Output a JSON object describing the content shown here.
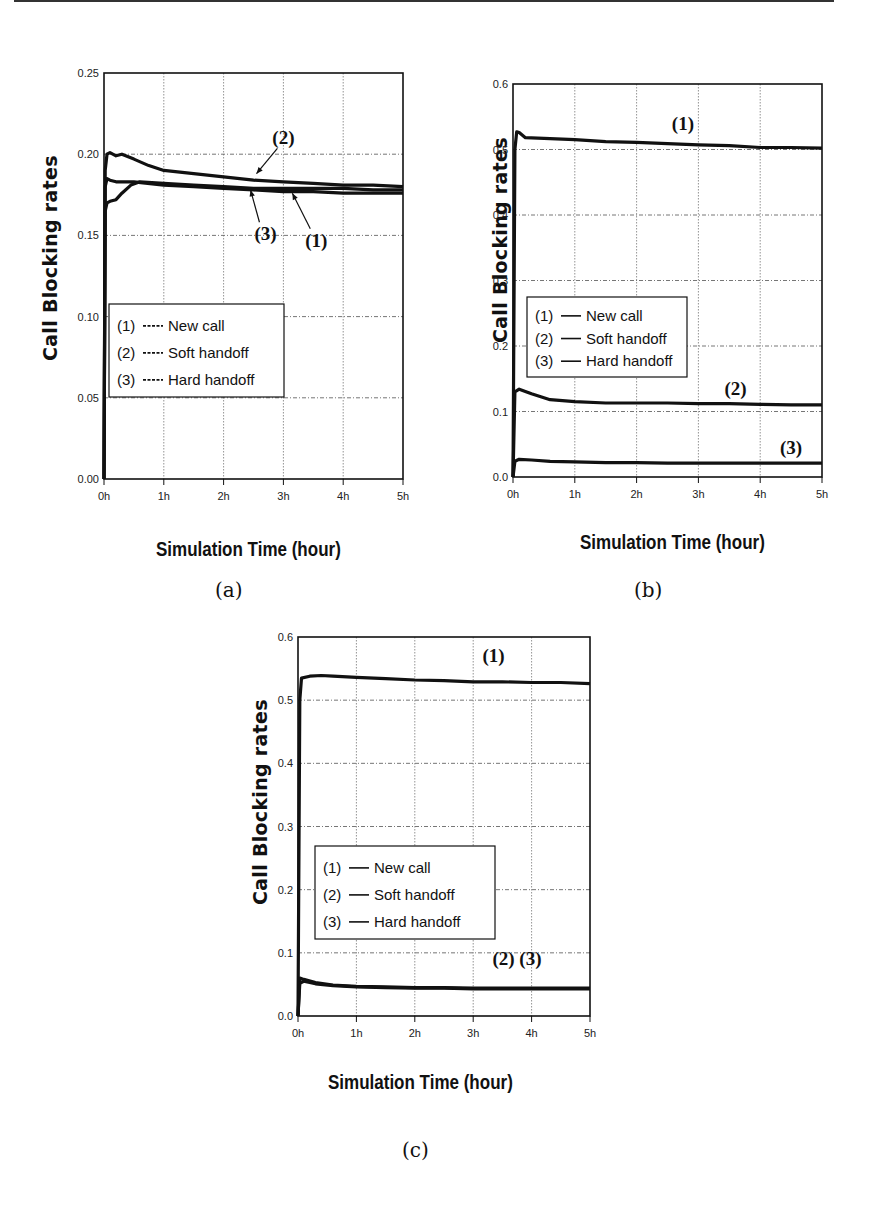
{
  "figure": {
    "captions": [
      "(a)",
      "(b)",
      "(c)"
    ],
    "xlabel": "Simulation Time (hour)",
    "ylabel": "Call Blocking rates"
  },
  "chart_data": [
    {
      "id": "a",
      "type": "line",
      "caption": "(a)",
      "xlabel": "Simulation Time (hour)",
      "ylabel": "Call Blocking rates",
      "x_ticks": [
        "0h",
        "1h",
        "2h",
        "3h",
        "4h",
        "5h"
      ],
      "y_ticks": [
        "0.00",
        "0.05",
        "0.10",
        "0.15",
        "0.20",
        "0.25"
      ],
      "xlim": [
        0,
        5
      ],
      "ylim": [
        0,
        0.25
      ],
      "grid": true,
      "legend": {
        "position": "lower-left",
        "entries": [
          {
            "marker": "(1)",
            "line": "dashed",
            "label": "New call"
          },
          {
            "marker": "(2)",
            "line": "dashed",
            "label": "Soft handoff"
          },
          {
            "marker": "(3)",
            "line": "dashed",
            "label": "Hard handoff"
          }
        ]
      },
      "annotations": [
        {
          "text": "(2)",
          "x": 3.0,
          "y": 0.206,
          "arrow_to": [
            2.55,
            0.188
          ]
        },
        {
          "text": "(3)",
          "x": 2.7,
          "y": 0.147,
          "arrow_to": [
            2.45,
            0.178
          ]
        },
        {
          "text": "(1)",
          "x": 3.55,
          "y": 0.143,
          "arrow_to": [
            3.15,
            0.176
          ]
        }
      ],
      "series": [
        {
          "name": "(1) New call",
          "x": [
            0,
            0.02,
            0.05,
            0.1,
            0.2,
            0.3,
            0.5,
            1,
            1.5,
            2,
            2.5,
            3,
            3.5,
            4,
            4.5,
            5
          ],
          "values": [
            0,
            0.18,
            0.185,
            0.184,
            0.183,
            0.183,
            0.183,
            0.181,
            0.18,
            0.179,
            0.178,
            0.177,
            0.177,
            0.176,
            0.176,
            0.176
          ]
        },
        {
          "name": "(2) Soft handoff",
          "x": [
            0,
            0.02,
            0.05,
            0.1,
            0.2,
            0.3,
            0.5,
            0.75,
            1,
            1.5,
            2,
            2.5,
            3,
            3.5,
            4,
            4.5,
            5
          ],
          "values": [
            0,
            0.19,
            0.2,
            0.201,
            0.199,
            0.2,
            0.197,
            0.193,
            0.19,
            0.188,
            0.186,
            0.184,
            0.183,
            0.182,
            0.181,
            0.181,
            0.18
          ]
        },
        {
          "name": "(3) Hard handoff",
          "x": [
            0,
            0.02,
            0.05,
            0.1,
            0.2,
            0.3,
            0.45,
            0.6,
            1,
            1.5,
            2,
            2.5,
            3,
            3.5,
            4,
            4.5,
            5
          ],
          "values": [
            0,
            0.165,
            0.17,
            0.171,
            0.172,
            0.176,
            0.181,
            0.183,
            0.182,
            0.181,
            0.18,
            0.179,
            0.179,
            0.179,
            0.179,
            0.178,
            0.178
          ]
        }
      ]
    },
    {
      "id": "b",
      "type": "line",
      "caption": "(b)",
      "xlabel": "Simulation Time (hour)",
      "ylabel": "Call Blocking rates",
      "x_ticks": [
        "0h",
        "1h",
        "2h",
        "3h",
        "4h",
        "5h"
      ],
      "y_ticks": [
        "0.0",
        "0.1",
        "0.2",
        "0.3",
        "0.4",
        "0.5",
        "0.6"
      ],
      "xlim": [
        0,
        5
      ],
      "ylim": [
        0,
        0.6
      ],
      "grid": true,
      "legend": {
        "position": "center-left",
        "entries": [
          {
            "marker": "(1)",
            "line": "solid",
            "label": "New call"
          },
          {
            "marker": "(2)",
            "line": "solid",
            "label": "Soft handoff"
          },
          {
            "marker": "(3)",
            "line": "solid",
            "label": "Hard handoff"
          }
        ]
      },
      "annotations": [
        {
          "text": "(1)",
          "x": 2.75,
          "y": 0.53
        },
        {
          "text": "(2)",
          "x": 3.6,
          "y": 0.125
        },
        {
          "text": "(3)",
          "x": 4.5,
          "y": 0.035
        }
      ],
      "series": [
        {
          "name": "(1) New call",
          "x": [
            0,
            0.03,
            0.06,
            0.1,
            0.2,
            0.5,
            1,
            1.5,
            2,
            2.5,
            3,
            3.5,
            4,
            4.5,
            5
          ],
          "values": [
            0,
            0.5,
            0.527,
            0.526,
            0.518,
            0.517,
            0.515,
            0.512,
            0.511,
            0.509,
            0.507,
            0.506,
            0.503,
            0.503,
            0.502
          ]
        },
        {
          "name": "(2) Soft handoff",
          "x": [
            0,
            0.03,
            0.1,
            0.3,
            0.6,
            1,
            1.5,
            2,
            2.5,
            3,
            3.5,
            4,
            4.5,
            5
          ],
          "values": [
            0,
            0.13,
            0.134,
            0.127,
            0.118,
            0.115,
            0.113,
            0.113,
            0.113,
            0.112,
            0.112,
            0.111,
            0.11,
            0.11
          ]
        },
        {
          "name": "(3) Hard handoff",
          "x": [
            0,
            0.03,
            0.1,
            0.3,
            0.6,
            1,
            1.5,
            2,
            2.5,
            3,
            3.5,
            4,
            4.5,
            5
          ],
          "values": [
            0,
            0.024,
            0.027,
            0.026,
            0.024,
            0.023,
            0.022,
            0.022,
            0.021,
            0.021,
            0.021,
            0.021,
            0.021,
            0.021
          ]
        }
      ]
    },
    {
      "id": "c",
      "type": "line",
      "caption": "(c)",
      "xlabel": "Simulation Time (hour)",
      "ylabel": "Call Blocking rates",
      "x_ticks": [
        "0h",
        "1h",
        "2h",
        "3h",
        "4h",
        "5h"
      ],
      "y_ticks": [
        "0.0",
        "0.1",
        "0.2",
        "0.3",
        "0.4",
        "0.5",
        "0.6"
      ],
      "xlim": [
        0,
        5
      ],
      "ylim": [
        0,
        0.6
      ],
      "grid": true,
      "legend": {
        "position": "center-left",
        "entries": [
          {
            "marker": "(1)",
            "line": "solid",
            "label": "New call"
          },
          {
            "marker": "(2)",
            "line": "solid",
            "label": "Soft handoff"
          },
          {
            "marker": "(3)",
            "line": "solid",
            "label": "Hard handoff"
          }
        ]
      },
      "annotations": [
        {
          "text": "(1)",
          "x": 3.35,
          "y": 0.56
        },
        {
          "text": "(2) (3)",
          "x": 3.75,
          "y": 0.08
        }
      ],
      "series": [
        {
          "name": "(1) New call",
          "x": [
            0,
            0.03,
            0.06,
            0.2,
            0.4,
            0.6,
            1,
            1.5,
            2,
            2.5,
            3,
            3.5,
            4,
            4.5,
            5
          ],
          "values": [
            0,
            0.5,
            0.535,
            0.538,
            0.539,
            0.538,
            0.536,
            0.534,
            0.532,
            0.531,
            0.529,
            0.529,
            0.528,
            0.528,
            0.526
          ]
        },
        {
          "name": "(2) Soft handoff",
          "x": [
            0,
            0.03,
            0.1,
            0.3,
            0.6,
            1,
            1.5,
            2,
            2.5,
            3,
            3.5,
            4,
            4.5,
            5
          ],
          "values": [
            0,
            0.06,
            0.058,
            0.053,
            0.049,
            0.047,
            0.046,
            0.045,
            0.045,
            0.044,
            0.044,
            0.044,
            0.044,
            0.044
          ]
        },
        {
          "name": "(3) Hard handoff",
          "x": [
            0,
            0.03,
            0.1,
            0.3,
            0.6,
            1,
            1.5,
            2,
            2.5,
            3,
            3.5,
            4,
            4.5,
            5
          ],
          "values": [
            0,
            0.052,
            0.055,
            0.051,
            0.048,
            0.046,
            0.045,
            0.044,
            0.044,
            0.043,
            0.043,
            0.043,
            0.043,
            0.043
          ]
        }
      ]
    }
  ]
}
